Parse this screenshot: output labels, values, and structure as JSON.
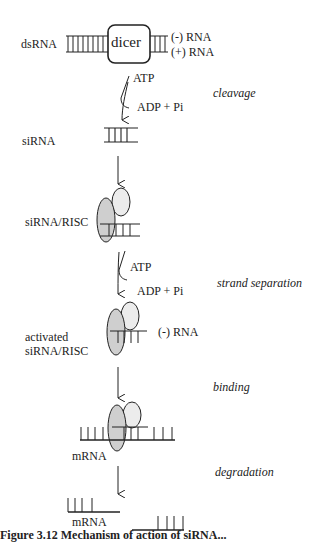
{
  "diagram": {
    "nodes": [
      {
        "id": "dsrna",
        "label": "dsRNA"
      },
      {
        "id": "dicer",
        "label": "dicer"
      },
      {
        "id": "minus_rna_top",
        "label": "(-) RNA"
      },
      {
        "id": "plus_rna_top",
        "label": "(+) RNA"
      },
      {
        "id": "sirna",
        "label": "siRNA"
      },
      {
        "id": "sirna_risc",
        "label": "siRNA/RISC"
      },
      {
        "id": "activated_line1",
        "label": "activated"
      },
      {
        "id": "activated_line2",
        "label": "siRNA/RISC"
      },
      {
        "id": "minus_rna_mid",
        "label": "(-) RNA"
      },
      {
        "id": "mrna_bound",
        "label": "mRNA"
      },
      {
        "id": "mrna_degraded",
        "label": "mRNA"
      }
    ],
    "cofactors": [
      {
        "step": "cleavage",
        "in": "ATP",
        "out": "ADP + Pi"
      },
      {
        "step": "strand separation",
        "in": "ATP",
        "out": "ADP + Pi"
      }
    ],
    "steps": [
      {
        "label": "cleavage"
      },
      {
        "label": "strand separation"
      },
      {
        "label": "binding"
      },
      {
        "label": "degradation"
      }
    ],
    "edges": [
      {
        "from": "dsrna",
        "to": "sirna",
        "label": "cleavage"
      },
      {
        "from": "sirna",
        "to": "sirna_risc",
        "label": ""
      },
      {
        "from": "sirna_risc",
        "to": "activated",
        "label": "strand separation"
      },
      {
        "from": "activated",
        "to": "mrna_bound",
        "label": "binding"
      },
      {
        "from": "mrna_bound",
        "to": "mrna_degraded",
        "label": "degradation"
      }
    ],
    "caption": "Figure 3.12 Mechanism of action of siRNA..."
  },
  "colors": {
    "line": "#222222",
    "protein_fill_dark": "#cfcfcf",
    "protein_fill_light": "#ececec",
    "background": "#ffffff"
  }
}
